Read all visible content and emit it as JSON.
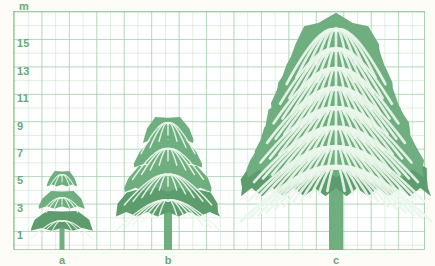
{
  "chart_data": {
    "type": "bar",
    "title": "",
    "xlabel": "",
    "ylabel": "m",
    "unit": "m",
    "categories": [
      "a",
      "b",
      "c"
    ],
    "values": [
      5,
      8.5,
      14
    ],
    "ylim": [
      0,
      16
    ],
    "yticks": [
      1,
      3,
      5,
      7,
      9,
      11,
      13,
      15
    ],
    "ytick_labels": [
      "1",
      "3",
      "5",
      "7",
      "9",
      "11",
      "13",
      "15"
    ],
    "grid": true,
    "legend": false,
    "series": [
      {
        "name": "tree height",
        "values": [
          5,
          8.5,
          14
        ]
      }
    ]
  },
  "axis": {
    "unit_label": "m",
    "y_ticks": [
      {
        "label": "15",
        "value": 15
      },
      {
        "label": "13",
        "value": 13
      },
      {
        "label": "11",
        "value": 11
      },
      {
        "label": "9",
        "value": 9
      },
      {
        "label": "7",
        "value": 7
      },
      {
        "label": "5",
        "value": 5
      },
      {
        "label": "3",
        "value": 3
      },
      {
        "label": "1",
        "value": 1
      }
    ],
    "x_ticks": [
      {
        "label": "a",
        "x": 62
      },
      {
        "label": "b",
        "x": 168
      },
      {
        "label": "c",
        "x": 336
      }
    ]
  },
  "trees": [
    {
      "name": "tree-a",
      "label": "a",
      "height_m": 5,
      "center_x": 62,
      "crown_w": 62,
      "crown_h": 66,
      "trunk_w": 5,
      "trunk_h": 22
    },
    {
      "name": "tree-b",
      "label": "b",
      "height_m": 8.5,
      "center_x": 168,
      "crown_w": 104,
      "crown_h": 110,
      "trunk_w": 8,
      "trunk_h": 38
    },
    {
      "name": "tree-c",
      "label": "c",
      "height_m": 14,
      "center_x": 336,
      "crown_w": 190,
      "crown_h": 196,
      "trunk_w": 14,
      "trunk_h": 62
    }
  ],
  "colors": {
    "foliage": "#6fae7f",
    "foliage_dark": "#5d9c6d",
    "vein": "#eaf6ec",
    "grid_major": "#8cc396",
    "grid_minor": "#afd7b9",
    "text": "#6aa978",
    "paper": "#fdfcf6"
  }
}
